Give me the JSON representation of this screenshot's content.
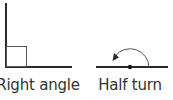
{
  "figures": [
    {
      "id": "right-angle",
      "label": "Right angle",
      "label_center_x": 38
    },
    {
      "id": "half-turn",
      "label": "Half turn",
      "label_center_x": 130
    }
  ],
  "colors": {
    "line": "#2b2b2b",
    "thin_line": "#555555",
    "text": "#333333"
  }
}
